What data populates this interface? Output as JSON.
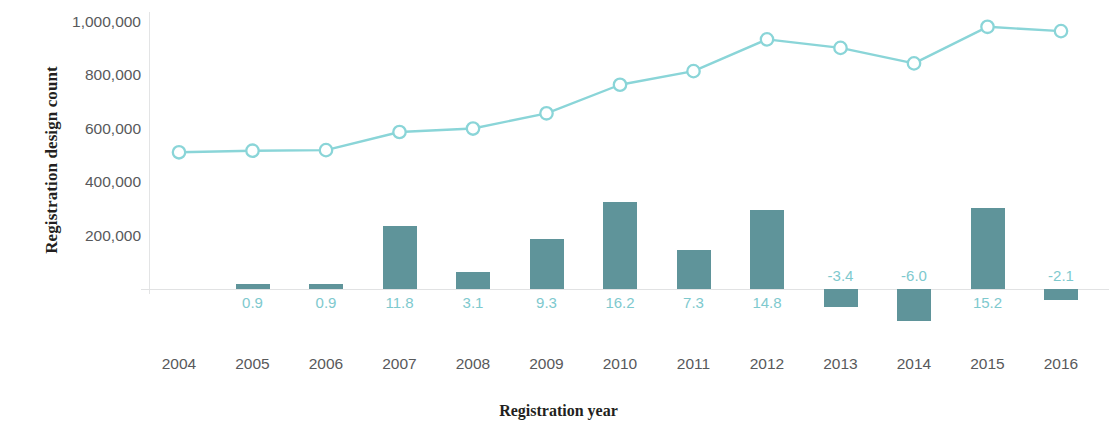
{
  "chart_data": {
    "type": "bar",
    "title": "",
    "xlabel": "Registration year",
    "ylabel": "Registration design count",
    "categories": [
      "2004",
      "2005",
      "2006",
      "2007",
      "2008",
      "2009",
      "2010",
      "2011",
      "2012",
      "2013",
      "2014",
      "2015",
      "2016"
    ],
    "ylim": [
      0,
      1000000
    ],
    "yticks": [
      200000,
      400000,
      600000,
      800000,
      1000000
    ],
    "ytick_labels": [
      "200,000",
      "400,000",
      "600,000",
      "800,000",
      "1,000,000"
    ],
    "grid": false,
    "legend": "none",
    "series": [
      {
        "name": "Registration design count",
        "type": "line",
        "marker": "open-circle",
        "color": "#8ad5d8",
        "values": [
          512000,
          518000,
          520000,
          588000,
          601000,
          658000,
          765000,
          816000,
          935000,
          903000,
          845000,
          982000,
          966000
        ]
      },
      {
        "name": "Growth rate (%)",
        "type": "bar",
        "color": "#5f949a",
        "values": [
          null,
          0.9,
          0.9,
          11.8,
          3.1,
          9.3,
          16.2,
          7.3,
          14.8,
          -3.4,
          -6.0,
          15.2,
          -2.1
        ],
        "data_labels": [
          "",
          "0.9",
          "0.9",
          "11.8",
          "3.1",
          "9.3",
          "16.2",
          "7.3",
          "14.8",
          "-3.4",
          "-6.0",
          "15.2",
          "-2.1"
        ],
        "label_color": "#7ec9ce"
      }
    ]
  },
  "axis": {
    "y_title": "Registration design count",
    "x_title": "Registration year"
  }
}
